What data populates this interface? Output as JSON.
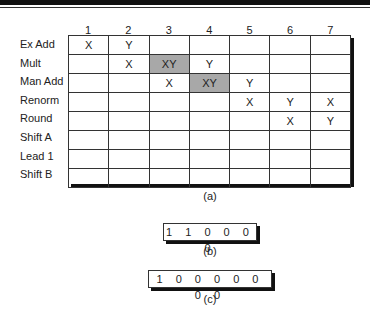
{
  "reservation_table": {
    "columns": [
      "1",
      "2",
      "3",
      "4",
      "5",
      "6",
      "7"
    ],
    "rows": [
      {
        "label": "Ex Add",
        "cells": [
          "X",
          "Y",
          "",
          "",
          "",
          "",
          ""
        ],
        "shaded": []
      },
      {
        "label": "Mult",
        "cells": [
          "",
          "X",
          "XY",
          "Y",
          "",
          "",
          ""
        ],
        "shaded": [
          2
        ]
      },
      {
        "label": "Man Add",
        "cells": [
          "",
          "",
          "X",
          "XY",
          "Y",
          "",
          ""
        ],
        "shaded": [
          3
        ]
      },
      {
        "label": "Renorm",
        "cells": [
          "",
          "",
          "",
          "",
          "X",
          "Y",
          "X"
        ],
        "shaded": []
      },
      {
        "label": "Round",
        "cells": [
          "",
          "",
          "",
          "",
          "",
          "X",
          "Y"
        ],
        "shaded": []
      },
      {
        "label": "Shift A",
        "cells": [
          "",
          "",
          "",
          "",
          "",
          "",
          ""
        ],
        "shaded": []
      },
      {
        "label": "Lead 1",
        "cells": [
          "",
          "",
          "",
          "",
          "",
          "",
          ""
        ],
        "shaded": []
      },
      {
        "label": "Shift B",
        "cells": [
          "",
          "",
          "",
          "",
          "",
          "",
          ""
        ],
        "shaded": []
      }
    ],
    "caption": "(a)",
    "shade_color": "#a8a8a8"
  },
  "register_b": {
    "value": "1 1 0 0 0 0",
    "caption": "(b)"
  },
  "register_c": {
    "value": "1 0 0 0 0 0 0 0",
    "caption": "(c)"
  }
}
